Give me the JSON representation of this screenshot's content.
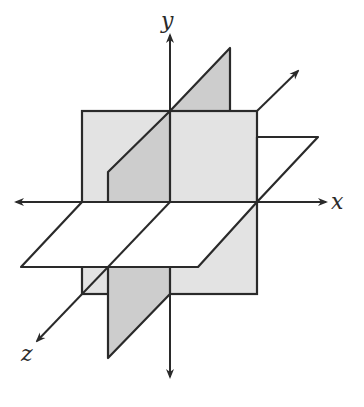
{
  "diagram": {
    "axes": [
      {
        "name": "x",
        "label": "x"
      },
      {
        "name": "y",
        "label": "y"
      },
      {
        "name": "z",
        "label": "z"
      }
    ],
    "planes": [
      {
        "name": "xy-plane",
        "color": "#e3e3e3"
      },
      {
        "name": "yz-plane",
        "color": "#cdcdcd"
      },
      {
        "name": "xz-plane",
        "color": "#ffffff"
      }
    ],
    "stroke_color": "#2a2a2a"
  }
}
